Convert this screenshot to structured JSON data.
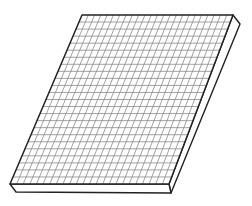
{
  "illustration": {
    "subject": "grid board",
    "description": "Line drawing of a flat square-ruled board shown in oblique perspective with visible thickness",
    "grid": {
      "columns": 24,
      "rows": 24
    },
    "colors": {
      "background": "#ffffff",
      "outline": "#222222",
      "grid_lines": "#8a8a8a",
      "face": "#ffffff",
      "edge_face": "#ffffff"
    }
  }
}
